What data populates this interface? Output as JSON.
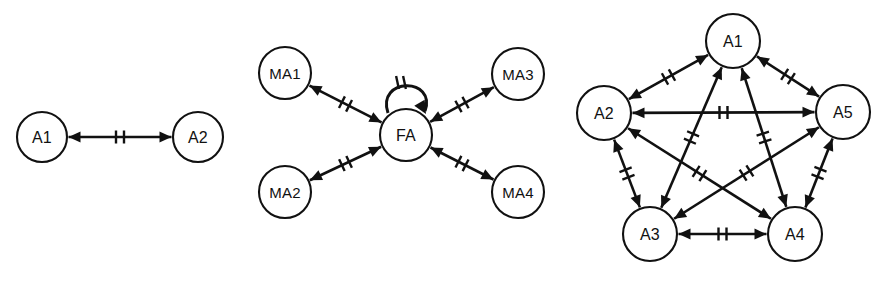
{
  "figure": {
    "background_color": "#ffffff",
    "line_color": "#111111",
    "node_fill": "#ffffff",
    "width": 872,
    "height": 281
  },
  "panels": [
    {
      "id": "panel-pair",
      "name": "two-agent-topology",
      "nodes": [
        {
          "id": "A1",
          "label": "A1",
          "cx": 42,
          "cy": 137,
          "r": 25
        },
        {
          "id": "A2",
          "label": "A2",
          "cx": 198,
          "cy": 137,
          "r": 25
        }
      ],
      "edges": [
        {
          "from": "A1",
          "to": "A2",
          "bidirectional": true,
          "ticks": 2
        }
      ]
    },
    {
      "id": "panel-star",
      "name": "facilitator-star-topology",
      "nodes": [
        {
          "id": "MA1",
          "label": "MA1",
          "cx": 285,
          "cy": 73,
          "r": 26
        },
        {
          "id": "MA2",
          "label": "MA2",
          "cx": 285,
          "cy": 192,
          "r": 26
        },
        {
          "id": "MA3",
          "label": "MA3",
          "cx": 518,
          "cy": 74,
          "r": 26
        },
        {
          "id": "MA4",
          "label": "MA4",
          "cx": 518,
          "cy": 192,
          "r": 26
        },
        {
          "id": "FA",
          "label": "FA",
          "cx": 406,
          "cy": 135,
          "r": 26
        }
      ],
      "edges": [
        {
          "from": "FA",
          "to": "MA1",
          "bidirectional": true,
          "ticks": 2
        },
        {
          "from": "FA",
          "to": "MA2",
          "bidirectional": true,
          "ticks": 2
        },
        {
          "from": "FA",
          "to": "MA3",
          "bidirectional": true,
          "ticks": 2
        },
        {
          "from": "FA",
          "to": "MA4",
          "bidirectional": true,
          "ticks": 2
        }
      ],
      "self_loops": [
        {
          "node": "FA",
          "ticks": 2,
          "arrow": "inbound"
        }
      ]
    },
    {
      "id": "panel-complete",
      "name": "fully-connected-topology",
      "nodes": [
        {
          "id": "A1",
          "label": "A1",
          "cx": 733,
          "cy": 41,
          "r": 27
        },
        {
          "id": "A2",
          "label": "A2",
          "cx": 604,
          "cy": 113,
          "r": 27
        },
        {
          "id": "A5",
          "label": "A5",
          "cx": 843,
          "cy": 112,
          "r": 27
        },
        {
          "id": "A3",
          "label": "A3",
          "cx": 650,
          "cy": 234,
          "r": 27
        },
        {
          "id": "A4",
          "label": "A4",
          "cx": 795,
          "cy": 234,
          "r": 27
        }
      ],
      "edges": [
        {
          "from": "A1",
          "to": "A2",
          "bidirectional": true,
          "ticks": 2
        },
        {
          "from": "A1",
          "to": "A5",
          "bidirectional": true,
          "ticks": 2
        },
        {
          "from": "A1",
          "to": "A3",
          "bidirectional": true,
          "ticks": 2
        },
        {
          "from": "A1",
          "to": "A4",
          "bidirectional": true,
          "ticks": 2
        },
        {
          "from": "A2",
          "to": "A5",
          "bidirectional": true,
          "ticks": 2
        },
        {
          "from": "A2",
          "to": "A3",
          "bidirectional": true,
          "ticks": 2
        },
        {
          "from": "A2",
          "to": "A4",
          "bidirectional": true,
          "ticks": 2
        },
        {
          "from": "A3",
          "to": "A4",
          "bidirectional": true,
          "ticks": 2
        },
        {
          "from": "A3",
          "to": "A5",
          "bidirectional": true,
          "ticks": 2
        },
        {
          "from": "A4",
          "to": "A5",
          "bidirectional": true,
          "ticks": 2
        }
      ]
    }
  ]
}
